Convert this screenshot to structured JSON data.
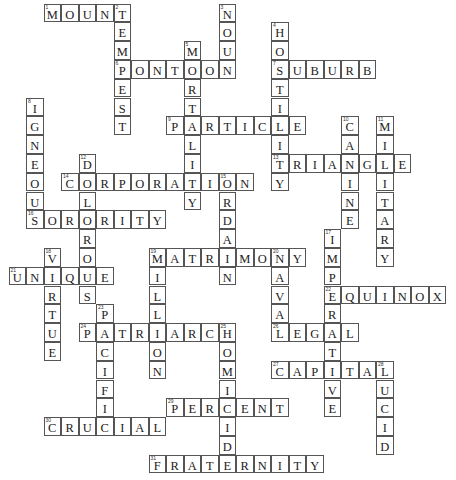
{
  "puzzle": {
    "type": "crossword",
    "cell": {
      "w": 17.5,
      "h": 18.8,
      "origin_x": 9,
      "origin_y": 4
    },
    "colors": {
      "border": "#555555",
      "text": "#222222",
      "background": "#ffffff"
    },
    "words": [
      {
        "num": 1,
        "dir": "across",
        "answer": "MOUNT",
        "col": 2,
        "row": 0
      },
      {
        "num": 2,
        "dir": "down",
        "answer": "TEMPEST",
        "col": 6,
        "row": 0
      },
      {
        "num": 3,
        "dir": "down",
        "answer": "NOUN",
        "col": 12,
        "row": 0
      },
      {
        "num": 4,
        "dir": "down",
        "answer": "HOSTILITY",
        "col": 15,
        "row": 1
      },
      {
        "num": 5,
        "dir": "down",
        "answer": "MORTALITY",
        "col": 10,
        "row": 2
      },
      {
        "num": 6,
        "dir": "across",
        "answer": "PONTOON",
        "col": 6,
        "row": 3
      },
      {
        "num": 7,
        "dir": "across",
        "answer": "SUBURB",
        "col": 15,
        "row": 3
      },
      {
        "num": 8,
        "dir": "down",
        "answer": "IGNEOUS",
        "col": 1,
        "row": 5
      },
      {
        "num": 9,
        "dir": "across",
        "answer": "PARTICLE",
        "col": 9,
        "row": 6
      },
      {
        "num": 10,
        "dir": "down",
        "answer": "CANINE",
        "col": 19,
        "row": 6
      },
      {
        "num": 11,
        "dir": "down",
        "answer": "MILITARY",
        "col": 21,
        "row": 6
      },
      {
        "num": 12,
        "dir": "down",
        "answer": "DOLOROUS",
        "col": 4,
        "row": 8
      },
      {
        "num": 13,
        "dir": "across",
        "answer": "TRIANGLE",
        "col": 15,
        "row": 8
      },
      {
        "num": 14,
        "dir": "across",
        "answer": "CORPORATION",
        "col": 3,
        "row": 9
      },
      {
        "num": 15,
        "dir": "down",
        "answer": "ORDAIN",
        "col": 12,
        "row": 9
      },
      {
        "num": 16,
        "dir": "across",
        "answer": "SORORITY",
        "col": 1,
        "row": 11
      },
      {
        "num": 17,
        "dir": "down",
        "answer": "IMPERATIVE",
        "col": 18,
        "row": 12
      },
      {
        "num": 18,
        "dir": "down",
        "answer": "VIRTUE",
        "col": 2,
        "row": 13
      },
      {
        "num": 19,
        "dir": "across",
        "answer": "MATRIMONY",
        "col": 8,
        "row": 13
      },
      {
        "num": 19,
        "dir": "down",
        "answer": "MILLION",
        "col": 8,
        "row": 13,
        "shared_number": true
      },
      {
        "num": 20,
        "dir": "down",
        "answer": "NAVAL",
        "col": 15,
        "row": 13
      },
      {
        "num": 21,
        "dir": "across",
        "answer": "UNIQUE",
        "col": 0,
        "row": 14
      },
      {
        "num": 22,
        "dir": "across",
        "answer": "EQUINOX",
        "col": 18,
        "row": 15
      },
      {
        "num": 23,
        "dir": "down",
        "answer": "PACIFIC",
        "col": 5,
        "row": 16
      },
      {
        "num": 24,
        "dir": "across",
        "answer": "PATRIARCH",
        "col": 4,
        "row": 17
      },
      {
        "num": 25,
        "dir": "down",
        "answer": "HOMICIDE",
        "col": 12,
        "row": 17
      },
      {
        "num": 26,
        "dir": "across",
        "answer": "LEGAL",
        "col": 15,
        "row": 17
      },
      {
        "num": 27,
        "dir": "across",
        "answer": "CAPITAL",
        "col": 15,
        "row": 19
      },
      {
        "num": 28,
        "dir": "down",
        "answer": "LUCID",
        "col": 21,
        "row": 19
      },
      {
        "num": 29,
        "dir": "across",
        "answer": "PERCENT",
        "col": 9,
        "row": 21
      },
      {
        "num": 30,
        "dir": "across",
        "answer": "CRUCIAL",
        "col": 2,
        "row": 22
      },
      {
        "num": 31,
        "dir": "across",
        "answer": "FRATERNITY",
        "col": 8,
        "row": 24
      }
    ]
  }
}
